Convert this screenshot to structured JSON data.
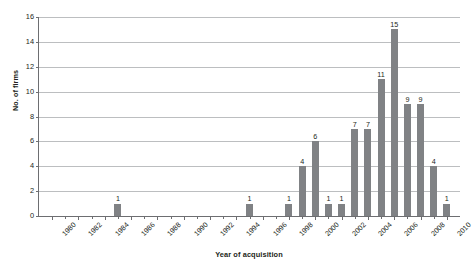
{
  "chart_data": {
    "type": "bar",
    "title": "",
    "xlabel": "Year of acquisition",
    "ylabel": "No. of firms",
    "grid": true,
    "legend": "none",
    "ylim": [
      0,
      16
    ],
    "ytick_step": 2,
    "yticks": [
      "0",
      "2",
      "4",
      "6",
      "8",
      "10",
      "12",
      "14",
      "16"
    ],
    "xlim": [
      1979,
      2011
    ],
    "xticks": [
      "1980",
      "1982",
      "1984",
      "1986",
      "1988",
      "1990",
      "1992",
      "1994",
      "1996",
      "1998",
      "2000",
      "2002",
      "2004",
      "2006",
      "2008",
      "2010"
    ],
    "bar_color": "#808285",
    "gridline_color": "#bcbec0",
    "axis_color": "#6d6e71",
    "categories": [
      "1980",
      "1981",
      "1982",
      "1983",
      "1984",
      "1985",
      "1986",
      "1987",
      "1988",
      "1989",
      "1990",
      "1991",
      "1992",
      "1993",
      "1994",
      "1995",
      "1996",
      "1997",
      "1998",
      "1999",
      "2000",
      "2001",
      "2002",
      "2003",
      "2004",
      "2005",
      "2006",
      "2007",
      "2008",
      "2009",
      "2010"
    ],
    "values": [
      0,
      0,
      0,
      0,
      0,
      1,
      0,
      0,
      0,
      0,
      0,
      0,
      0,
      0,
      0,
      1,
      0,
      0,
      1,
      4,
      6,
      1,
      1,
      7,
      7,
      11,
      15,
      9,
      9,
      4,
      1
    ],
    "bars": [
      {
        "year": "1985",
        "value": 1,
        "label": "1"
      },
      {
        "year": "1995",
        "value": 1,
        "label": "1"
      },
      {
        "year": "1998",
        "value": 1,
        "label": "1"
      },
      {
        "year": "1999",
        "value": 4,
        "label": "4"
      },
      {
        "year": "2000",
        "value": 6,
        "label": "6"
      },
      {
        "year": "2001",
        "value": 1,
        "label": "1"
      },
      {
        "year": "2002",
        "value": 1,
        "label": "1"
      },
      {
        "year": "2003",
        "value": 7,
        "label": "7"
      },
      {
        "year": "2004",
        "value": 7,
        "label": "7"
      },
      {
        "year": "2005",
        "value": 11,
        "label": "11"
      },
      {
        "year": "2006",
        "value": 15,
        "label": "15"
      },
      {
        "year": "2007",
        "value": 9,
        "label": "9"
      },
      {
        "year": "2008",
        "value": 9,
        "label": "9"
      },
      {
        "year": "2009",
        "value": 4,
        "label": "4"
      },
      {
        "year": "2010",
        "value": 1,
        "label": "1"
      }
    ]
  }
}
